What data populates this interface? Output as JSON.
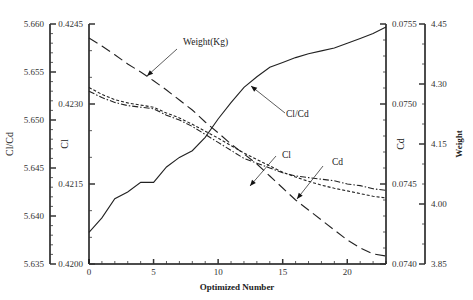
{
  "chart_data": {
    "type": "line",
    "title": "",
    "xlabel": "Optimized Number",
    "x": [
      0,
      1,
      2,
      3,
      4,
      5,
      6,
      7,
      8,
      9,
      10,
      11,
      12,
      13,
      14,
      15,
      16,
      17,
      18,
      19,
      20,
      21,
      22,
      23
    ],
    "xlim": [
      0,
      23
    ],
    "xticks": [
      0,
      5,
      10,
      15,
      20
    ],
    "grid": false,
    "axes": [
      {
        "id": "clcd",
        "label": "Cl/Cd",
        "position": "left-outer",
        "range": [
          5.635,
          5.66
        ],
        "ticks": [
          "5.635",
          "5.640",
          "5.645",
          "5.650",
          "5.655",
          "5.660"
        ]
      },
      {
        "id": "cl",
        "label": "Cl",
        "position": "left-inner",
        "range": [
          0.42,
          0.4245
        ],
        "ticks": [
          "0.4200",
          "0.4215",
          "0.4230",
          "0.4245"
        ]
      },
      {
        "id": "cd",
        "label": "Cd",
        "position": "right-inner",
        "range": [
          0.074,
          0.0755
        ],
        "ticks": [
          "0.0740",
          "0.0745",
          "0.0750",
          "0.0755"
        ]
      },
      {
        "id": "weight",
        "label": "Weight",
        "position": "right-outer",
        "range": [
          3.85,
          4.45
        ],
        "ticks": [
          "3.85",
          "4.00",
          "4.15",
          "4.30",
          "4.45"
        ]
      }
    ],
    "series": [
      {
        "name": "Cl/Cd",
        "axis": "clcd",
        "style": "solid",
        "values": [
          5.6383,
          5.6398,
          5.6418,
          5.6425,
          5.6435,
          5.6435,
          5.6451,
          5.6461,
          5.6468,
          5.6482,
          5.6501,
          5.6518,
          5.6534,
          5.6545,
          5.6555,
          5.656,
          5.6565,
          5.6569,
          5.6572,
          5.6575,
          5.658,
          5.6585,
          5.659,
          5.6597
        ]
      },
      {
        "name": "Cl",
        "axis": "cl",
        "style": "short-dash",
        "values": [
          0.42331,
          0.42318,
          0.42308,
          0.42302,
          0.42298,
          0.42294,
          0.42283,
          0.42274,
          0.42262,
          0.42249,
          0.42236,
          0.42222,
          0.42208,
          0.42196,
          0.42184,
          0.42172,
          0.42163,
          0.42155,
          0.42148,
          0.42142,
          0.42137,
          0.42132,
          0.42127,
          0.42124
        ]
      },
      {
        "name": "Cd",
        "axis": "cd",
        "style": "dash-dot",
        "values": [
          0.07508,
          0.07504,
          0.07501,
          0.07499,
          0.07498,
          0.07497,
          0.07493,
          0.0749,
          0.07486,
          0.07481,
          0.07476,
          0.07471,
          0.07466,
          0.07463,
          0.0746,
          0.07457,
          0.07455,
          0.07454,
          0.07453,
          0.07452,
          0.0745,
          0.07449,
          0.07447,
          0.07446
        ]
      },
      {
        "name": "Weight(Kg)",
        "axis": "weight",
        "style": "long-dash",
        "values": [
          4.415,
          4.395,
          4.373,
          4.35,
          4.33,
          4.308,
          4.285,
          4.26,
          4.235,
          4.205,
          4.178,
          4.15,
          4.125,
          4.1,
          4.07,
          4.04,
          4.01,
          3.985,
          3.96,
          3.935,
          3.91,
          3.89,
          3.875,
          3.87
        ]
      }
    ],
    "annotations": [
      {
        "text": "Weight(Kg)",
        "target_series": "Weight(Kg)"
      },
      {
        "text": "Cl/Cd",
        "target_series": "Cl/Cd"
      },
      {
        "text": "Cl",
        "target_series": "Cl"
      },
      {
        "text": "Cd",
        "target_series": "Cd"
      }
    ]
  }
}
